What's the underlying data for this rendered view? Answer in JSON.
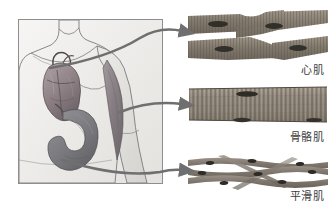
{
  "figure": {
    "background_color": "#ffffff"
  },
  "anatomy_panel": {
    "name": "human torso anatomical illustration",
    "border_color": "#8e8e8e",
    "background_color": "#f2f2f0",
    "organs": [
      {
        "id": "heart",
        "label": "heart",
        "color": "#9a8e92"
      },
      {
        "id": "stomach",
        "label": "stomach",
        "color": "#7f7f82"
      },
      {
        "id": "bicep",
        "label": "biceps brachii muscle",
        "color": "#8a8387"
      }
    ]
  },
  "tissues": [
    {
      "id": "cardiac",
      "label": "心肌",
      "micrograph_type": "branching striated fibers with central nuclei",
      "fiber_color": "#8b8378",
      "nucleus_color": "#3a352f"
    },
    {
      "id": "skeletal",
      "label": "骨骼肌",
      "micrograph_type": "single wide multinucleated fiber with transverse striations",
      "fiber_color": "#9b9287",
      "nucleus_color": "#3a352f"
    },
    {
      "id": "smooth",
      "label": "平滑肌",
      "micrograph_type": "interwoven spindle-shaped cells with central nuclei",
      "fiber_color": "#8e867c",
      "nucleus_color": "#332f2a"
    }
  ],
  "arrows": [
    {
      "id": "arrow-cardiac",
      "from": "heart",
      "to": "心肌",
      "color": "#6f6f6f"
    },
    {
      "id": "arrow-skeletal",
      "from": "bicep",
      "to": "骨骼肌",
      "color": "#6f6f6f"
    },
    {
      "id": "arrow-smooth",
      "from": "stomach",
      "to": "平滑肌",
      "color": "#6f6f6f"
    }
  ]
}
